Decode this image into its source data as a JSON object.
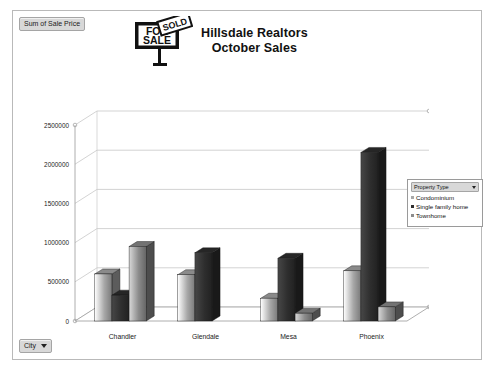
{
  "window": {
    "value_field_label": "Sum of Sale Price",
    "city_field_label": "City"
  },
  "title": {
    "line1": "Hillsdale Realtors",
    "line2": "October Sales",
    "logo": {
      "for_text": "FOR",
      "sale_text": "SALE",
      "sold_text": "SOLD"
    }
  },
  "legend": {
    "header_label": "Property Type",
    "items": [
      {
        "label": "Condominium",
        "color": "#a8a8a8"
      },
      {
        "label": "Single family home",
        "color": "#2e2e2e"
      },
      {
        "label": "Townhome",
        "color": "#8c8c8c"
      }
    ]
  },
  "chart_data": {
    "type": "bar",
    "title": "Hillsdale Realtors October Sales",
    "xlabel": "",
    "ylabel": "",
    "ylim": [
      0,
      2500000
    ],
    "yticks": [
      0,
      500000,
      1000000,
      1500000,
      2000000,
      2500000
    ],
    "ytick_labels": [
      "0",
      "500000",
      "1000000",
      "1500000",
      "2000000",
      "2500000"
    ],
    "categories": [
      "Chandler",
      "Glendale",
      "Mesa",
      "Phoenix"
    ],
    "grid": true,
    "legend_position": "right",
    "series": [
      {
        "name": "Condominium",
        "color": "#a8a8a8",
        "values": [
          600000,
          590000,
          290000,
          640000
        ]
      },
      {
        "name": "Single family home",
        "color": "#2e2e2e",
        "values": [
          330000,
          870000,
          800000,
          2150000
        ]
      },
      {
        "name": "Townhome",
        "color": "#8c8c8c",
        "values": [
          950000,
          null,
          100000,
          180000
        ]
      }
    ]
  }
}
